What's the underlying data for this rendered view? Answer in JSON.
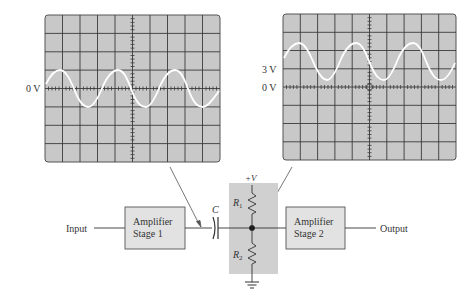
{
  "scope_left": {
    "zero_label": "0 V",
    "trace": "ac-sine",
    "dc_offset_divisions": 0,
    "amplitude_divisions": 1,
    "cycles_visible": 3
  },
  "scope_right": {
    "zero_label": "0 V",
    "offset_label": "3 V",
    "trace": "sine-with-dc-offset",
    "dc_offset_divisions": 1,
    "amplitude_divisions": 1,
    "cycles_visible": 3
  },
  "circuit": {
    "input_label": "Input",
    "stage1": {
      "line1": "Amplifier",
      "line2": "Stage 1"
    },
    "capacitor_label": "C",
    "supply_label": "+V",
    "r1_label": "R",
    "r1_sub": "1",
    "r2_label": "R",
    "r2_sub": "2",
    "stage2": {
      "line1": "Amplifier",
      "line2": "Stage 2"
    },
    "output_label": "Output",
    "ground_icon": "ground-symbol"
  },
  "colors": {
    "screen": "#c8c8c8",
    "grid": "#3a3a3a",
    "trace": "#ffffff",
    "shade": "#d0d0d0",
    "box_fill": "#e2e2e2",
    "line": "#333333"
  }
}
